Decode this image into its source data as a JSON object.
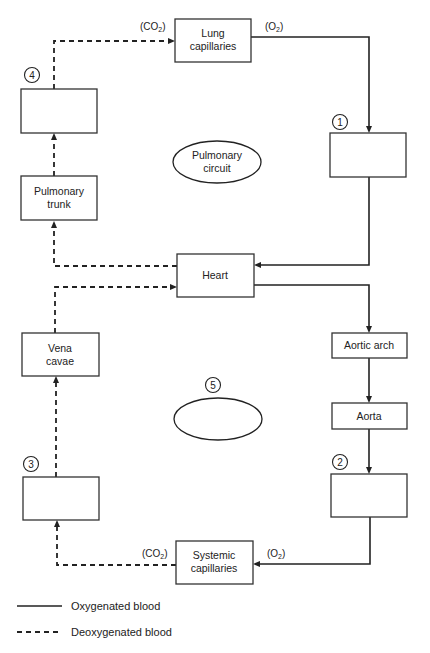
{
  "diagram": {
    "boxes": {
      "lung_capillaries": {
        "line1": "Lung",
        "line2": "capillaries"
      },
      "blank_1": {
        "number": "1",
        "label": ""
      },
      "pulmonary_trunk": {
        "line1": "Pulmonary",
        "line2": "trunk"
      },
      "blank_4": {
        "number": "4",
        "label": ""
      },
      "heart": {
        "label": "Heart"
      },
      "aortic_arch": {
        "label": "Aortic arch"
      },
      "aorta": {
        "label": "Aorta"
      },
      "blank_2": {
        "number": "2",
        "label": ""
      },
      "vena_cavae": {
        "line1": "Vena",
        "line2": "cavae"
      },
      "blank_3": {
        "number": "3",
        "label": ""
      },
      "systemic_capillaries": {
        "line1": "Systemic",
        "line2": "capillaries"
      }
    },
    "circuits": {
      "pulmonary": {
        "line1": "Pulmonary",
        "line2": "circuit"
      },
      "systemic_blank": {
        "number": "5",
        "label": ""
      }
    },
    "gas_labels": {
      "lung_in": {
        "text": "(CO",
        "sub": "2",
        "close": ")"
      },
      "lung_out": {
        "text": "(O",
        "sub": "2",
        "close": ")"
      },
      "systemic_out": {
        "text": "(CO",
        "sub": "2",
        "close": ")"
      },
      "systemic_in": {
        "text": "(O",
        "sub": "2",
        "close": ")"
      }
    },
    "legend": [
      {
        "style": "solid",
        "label": "Oxygenated blood"
      },
      {
        "style": "dashed",
        "label": "Deoxygenated blood"
      }
    ],
    "colors": {
      "line": "#222222",
      "box_stroke": "#333333",
      "background": "#ffffff"
    }
  }
}
